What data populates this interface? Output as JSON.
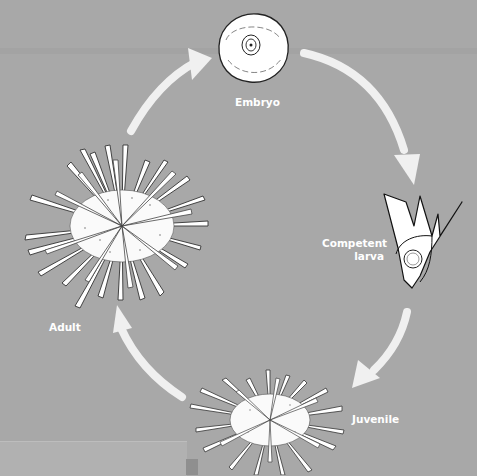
{
  "diagram": {
    "type": "life-cycle",
    "background_color": "#a8a8a8",
    "arrow_color": "#f0f0f0",
    "stages": [
      {
        "id": "embryo",
        "label": "Embryo"
      },
      {
        "id": "competent-larva",
        "label_line1": "Competent",
        "label_line2": "larva"
      },
      {
        "id": "juvenile",
        "label": "Juvenile"
      },
      {
        "id": "adult",
        "label": "Adult"
      }
    ],
    "edges": [
      {
        "from": "embryo",
        "to": "competent-larva"
      },
      {
        "from": "competent-larva",
        "to": "juvenile"
      },
      {
        "from": "juvenile",
        "to": "adult"
      },
      {
        "from": "adult",
        "to": "embryo"
      }
    ]
  }
}
